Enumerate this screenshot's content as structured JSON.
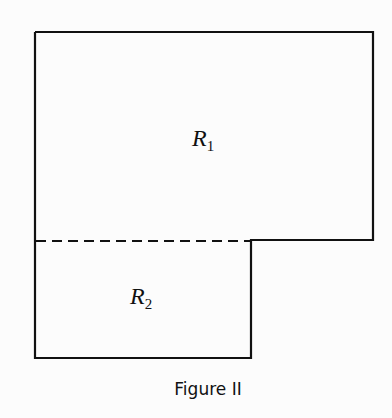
{
  "figure": {
    "caption": "Figure II",
    "regions": [
      {
        "id": "R1",
        "letter": "R",
        "subscript": "1"
      },
      {
        "id": "R2",
        "letter": "R",
        "subscript": "2"
      }
    ],
    "colors": {
      "stroke": "#111111",
      "background": "#fcfcfc"
    }
  }
}
